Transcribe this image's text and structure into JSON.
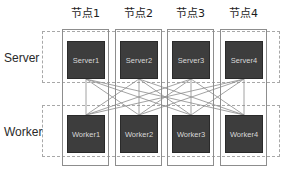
{
  "diagram": {
    "columns": [
      {
        "id": "node1",
        "header": "节点1",
        "x": 62,
        "width": 47
      },
      {
        "id": "node2",
        "header": "节点2",
        "x": 115,
        "width": 47
      },
      {
        "id": "node3",
        "header": "节点3",
        "x": 167,
        "width": 47
      },
      {
        "id": "node4",
        "header": "节点4",
        "x": 220,
        "width": 47
      }
    ],
    "rows": [
      {
        "id": "server",
        "label": "Server",
        "band_top": 31,
        "band_height": 52
      },
      {
        "id": "worker",
        "label": "Worker",
        "band_top": 105,
        "band_height": 52
      }
    ],
    "servers": [
      {
        "label": "Server1",
        "x": 67
      },
      {
        "label": "Server2",
        "x": 120
      },
      {
        "label": "Server3",
        "x": 172
      },
      {
        "label": "Server4",
        "x": 225
      }
    ],
    "workers": [
      {
        "label": "Worker1",
        "x": 67
      },
      {
        "label": "Worker2",
        "x": 120
      },
      {
        "label": "Worker3",
        "x": 172
      },
      {
        "label": "Worker4",
        "x": 225
      }
    ],
    "connections": {
      "description": "full bipartite mesh: every server connects to every worker",
      "from": [
        "Server1",
        "Server2",
        "Server3",
        "Server4"
      ],
      "to": [
        "Worker1",
        "Worker2",
        "Worker3",
        "Worker4"
      ],
      "count": 16
    },
    "colors": {
      "node_fill": "#3d3d3d",
      "node_text": "#d8d8d8",
      "column_border": "#8d8d8d",
      "band_border": "#a8a8a8",
      "connection_line": "#8c8c8c",
      "background": "#ffffff",
      "label_text": "#2a2a2a"
    }
  }
}
